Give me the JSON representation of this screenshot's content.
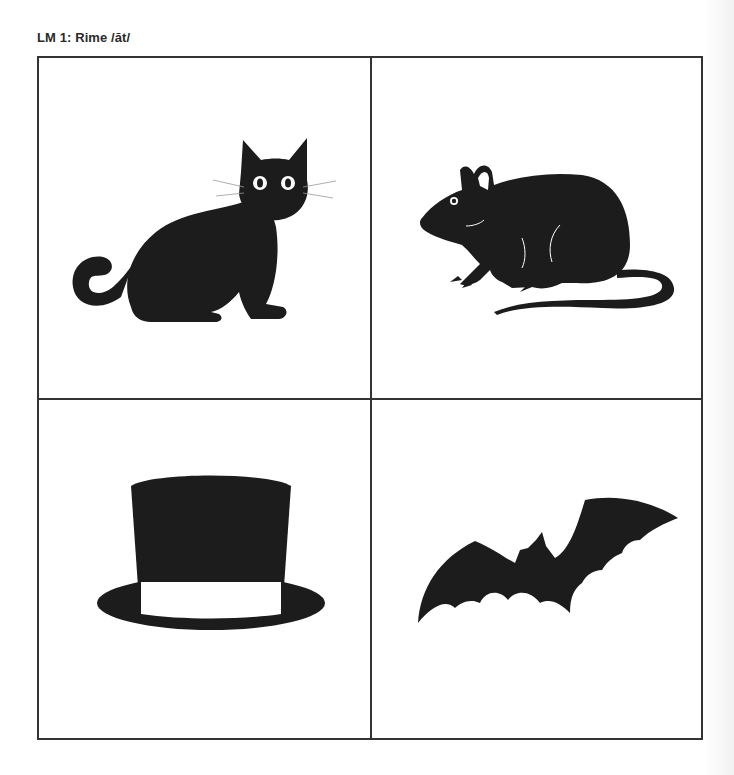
{
  "title": "LM 1: Rime /ăt/",
  "cards": [
    {
      "word": "cat",
      "icon": "cat-icon"
    },
    {
      "word": "rat",
      "icon": "rat-icon"
    },
    {
      "word": "hat",
      "icon": "hat-icon"
    },
    {
      "word": "bat",
      "icon": "bat-icon"
    }
  ],
  "colors": {
    "silhouette": "#1c1c1c",
    "border": "#333333",
    "background": "#ffffff"
  }
}
